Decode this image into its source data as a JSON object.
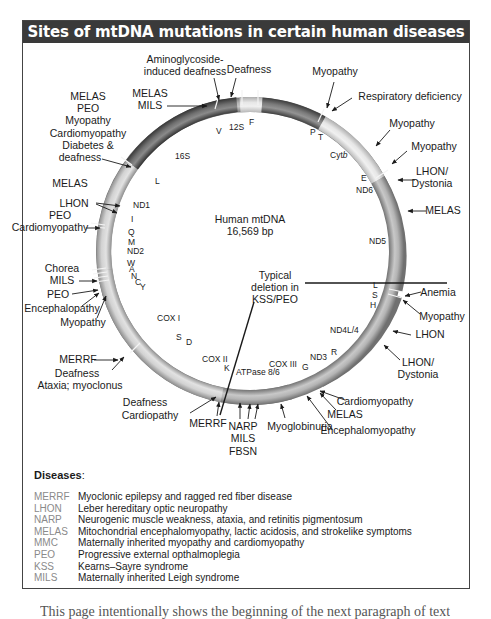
{
  "title": "Sites of mtDNA mutations in certain human diseases",
  "center": {
    "line1": "Human mtDNA",
    "line2": "16,569 bp"
  },
  "deletion": {
    "line1": "Typical",
    "line2": "deletion in",
    "line3": "KSS/PEO"
  },
  "genes": {
    "V": "V",
    "s12": "12S",
    "F": "F",
    "P": "P",
    "T": "T",
    "cytb": "Cyt",
    "cytb_italic": "b",
    "E": "E",
    "ND6": "ND6",
    "ND5": "ND5",
    "L2": "L",
    "S2": "S",
    "H": "H",
    "ND4L4": "ND4L/4",
    "R": "R",
    "ND3": "ND3",
    "G": "G",
    "COX3": "COX III",
    "ATP": "ATPase 8/6",
    "K": "K",
    "COX2": "COX II",
    "D": "D",
    "S1": "S",
    "COX1": "COX I",
    "Y": "Y",
    "C": "C",
    "N": "N",
    "A": "A",
    "W": "W",
    "ND2": "ND2",
    "M": "M",
    "Q": "Q",
    "I": "I",
    "ND1": "ND1",
    "L1": "L",
    "s16": "16S"
  },
  "annotations": {
    "amino1": "Aminoglycoside-",
    "amino2": "induced deafness",
    "deafness_top": "Deafness",
    "melas_mils_1": "MELAS",
    "melas_mils_2": "MILS",
    "left_block_1": "MELAS",
    "left_block_2": "PEO",
    "left_block_3": "Myopathy",
    "left_block_4": "Cardiomyopathy",
    "left_block_5": "Diabetes &",
    "left_block_6": "deafness",
    "melas_left": "MELAS",
    "lhon_left": "LHON",
    "peo_left": "PEO",
    "cardio_left": "Cardiomyopathy",
    "chorea": "Chorea",
    "mils_left": "MILS",
    "peo_left2": "PEO",
    "enceph_left": "Encephalopathy",
    "myopathy_left": "Myopathy",
    "merrf_left": "MERRF",
    "deaf_ataxia_1": "Deafness",
    "deaf_ataxia_2": "Ataxia; myoclonus",
    "deaf_cardio_1": "Deafness",
    "deaf_cardio_2": "Cardiopathy",
    "merrf_bottom": "MERRF",
    "narp": "NARP",
    "mils_bottom": "MILS",
    "fbsn": "FBSN",
    "myoglobinuria": "Myoglobinuria",
    "melas_bottom": "MELAS",
    "encephalomyopathy": "Encephalomyopathy",
    "cardiomyopathy_br": "Cardiomyopathy",
    "lhon_dyst_br_1": "LHON/",
    "lhon_dyst_br_2": "Dystonia",
    "lhon_right": "LHON",
    "myopathy_right": "Myopathy",
    "anemia": "Anemia",
    "melas_right": "MELAS",
    "lhon_dyst_tr_1": "LHON/",
    "lhon_dyst_tr_2": "Dystonia",
    "myopathy_tr2": "Myopathy",
    "myopathy_tr1": "Myopathy",
    "resp_def": "Respiratory deficiency",
    "myopathy_top": "Myopathy"
  },
  "legend": {
    "title": "Diseases",
    "colon": ":",
    "items": [
      {
        "abbr": "MERRF",
        "def": "Myoclonic epilepsy and ragged red fiber disease"
      },
      {
        "abbr": "LHON",
        "def": "Leber hereditary optic neuropathy"
      },
      {
        "abbr": "NARP",
        "def": "Neurogenic muscle weakness, ataxia, and retinitis pigmentosum"
      },
      {
        "abbr": "MELAS",
        "def": "Mitochondrial encephalomyopathy, lactic acidosis, and strokelike symptoms"
      },
      {
        "abbr": "MMC",
        "def": "Maternally inherited myopathy and cardiomyopathy"
      },
      {
        "abbr": "PEO",
        "def": "Progressive external opthalmoplegia"
      },
      {
        "abbr": "KSS",
        "def": "Kearns–Sayre syndrome"
      },
      {
        "abbr": "MILS",
        "def": "Maternally inherited Leigh syndrome"
      }
    ]
  },
  "bottom_text": "This page intentionally shows the beginning of the next paragraph of text"
}
